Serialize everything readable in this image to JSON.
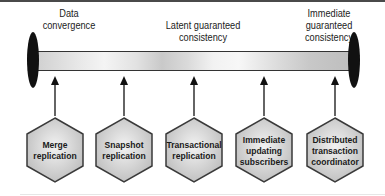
{
  "diagram": {
    "spectrum": {
      "left_label": [
        "Data",
        "convergence"
      ],
      "middle_label": [
        "Latent guaranteed",
        "consistency"
      ],
      "right_label": [
        "Immediate",
        "guaranteed",
        "consistency"
      ]
    },
    "nodes": [
      {
        "lines": [
          "Merge",
          "replication"
        ]
      },
      {
        "lines": [
          "Snapshot",
          "replication"
        ]
      },
      {
        "lines": [
          "Transactional",
          "replication"
        ]
      },
      {
        "lines": [
          "Immediate",
          "updating",
          "subscribers"
        ]
      },
      {
        "lines": [
          "Distributed",
          "transaction",
          "coordinator"
        ]
      }
    ],
    "colors": {
      "hex_fill": "#d6d6d6",
      "hex_stroke": "#3a3a3a",
      "cap": "#111111",
      "arrow": "#111111"
    }
  }
}
